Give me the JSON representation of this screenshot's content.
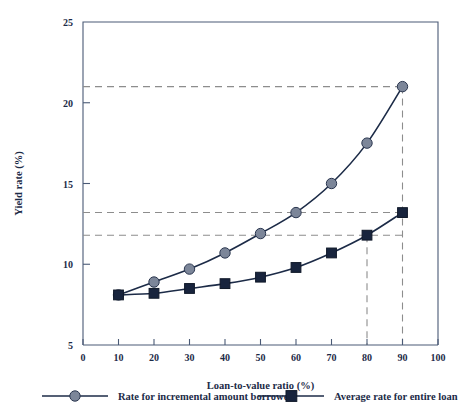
{
  "chart_data": {
    "type": "line",
    "title": "",
    "xlabel": "Loan-to-value ratio (%)",
    "ylabel": "Yield rate (%)",
    "xlim": [
      0,
      100
    ],
    "ylim": [
      5,
      25
    ],
    "xticks": [
      "0",
      "10",
      "20",
      "30",
      "40",
      "50",
      "60",
      "70",
      "80",
      "90",
      "100"
    ],
    "yticks": [
      "5",
      "10",
      "15",
      "20",
      "25"
    ],
    "grid": false,
    "legend_position": "below",
    "x": [
      10,
      20,
      30,
      40,
      50,
      60,
      70,
      80,
      90
    ],
    "series": [
      {
        "name": "Rate for incremental amount borrowed",
        "marker": "circle",
        "color": "#7c8699",
        "line_color": "#1c2b47",
        "values": [
          8.1,
          8.9,
          9.7,
          10.7,
          11.9,
          13.2,
          15.0,
          17.5,
          21.0
        ]
      },
      {
        "name": "Average rate for entire loan",
        "marker": "square",
        "color": "#18243d",
        "line_color": "#1c2b47",
        "values": [
          8.1,
          8.2,
          8.5,
          8.8,
          9.2,
          9.8,
          10.7,
          11.8,
          13.2
        ]
      }
    ],
    "reference_lines": {
      "horizontal": [
        21.0,
        13.2,
        11.8
      ],
      "vertical": [
        80,
        90
      ],
      "color": "#8d8d8d",
      "style": "dashed"
    }
  },
  "legend": {
    "entries": [
      {
        "label": "Rate for incremental amount borrowed",
        "marker": "circle-marker-icon"
      },
      {
        "label": "Average rate for entire loan",
        "marker": "square-marker-icon"
      }
    ]
  },
  "colors": {
    "frame": "#4a5a76",
    "axis": "#6c7party",
    "series_incremental": "#7c8699",
    "series_average": "#18243d",
    "reference": "#8d8d8d",
    "text": "#1c2b47"
  }
}
